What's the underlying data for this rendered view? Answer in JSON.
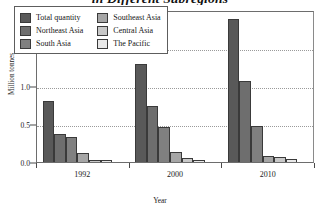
{
  "chart_data": {
    "type": "bar",
    "title": "in Different Subregions",
    "xlabel": "Year",
    "ylabel": "Million tonnes",
    "categories": [
      "1992",
      "2000",
      "2010"
    ],
    "ylim": [
      0.0,
      2.0
    ],
    "yticks": [
      "0.0",
      "0.5",
      "1.0",
      "1.5",
      "2.0"
    ],
    "ytick_values": [
      0.0,
      0.5,
      1.0,
      1.5,
      2.0
    ],
    "grid": true,
    "legend_position": "inside-top-left",
    "series": [
      {
        "name": "Total quantity",
        "color": "#595959",
        "values": [
          0.8,
          1.29,
          1.88
        ]
      },
      {
        "name": "Northeast Asia",
        "color": "#6e6e6e",
        "values": [
          0.37,
          0.74,
          1.06
        ]
      },
      {
        "name": "South Asia",
        "color": "#808080",
        "values": [
          0.33,
          0.46,
          0.48
        ]
      },
      {
        "name": "Southeast Asia",
        "color": "#a6a6a6",
        "values": [
          0.12,
          0.13,
          0.08
        ]
      },
      {
        "name": "Central Asia",
        "color": "#c8c8c8",
        "values": [
          0.03,
          0.05,
          0.06
        ]
      },
      {
        "name": "The Pacific",
        "color": "#e8e8e8",
        "values": [
          0.02,
          0.03,
          0.04
        ]
      }
    ]
  },
  "axes": {
    "y_title": "Million tonnes",
    "x_title": "Year"
  }
}
